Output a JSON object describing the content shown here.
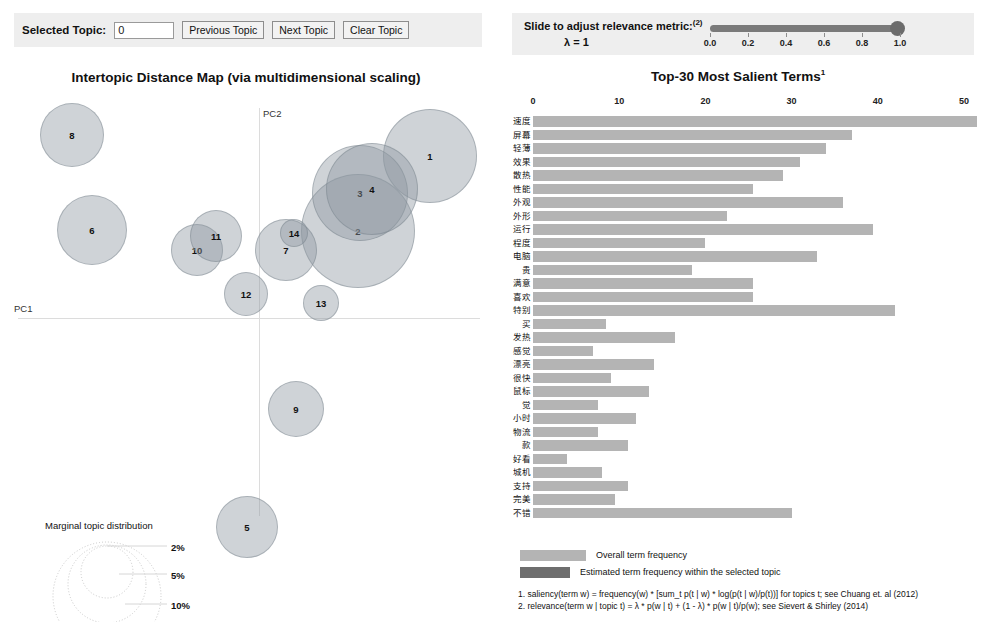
{
  "topic_control": {
    "label": "Selected Topic:",
    "selected_topic_value": "0",
    "previous_label": "Previous Topic",
    "next_label": "Next Topic",
    "clear_label": "Clear Topic"
  },
  "relevance_control": {
    "title": "Slide to adjust relevance metric:",
    "title_superscript": "(2)",
    "lambda_label": "λ = 1",
    "slider_value": 1.0,
    "tick_labels": [
      "0.0",
      "0.2",
      "0.4",
      "0.6",
      "0.8",
      "1.0"
    ]
  },
  "left_panel": {
    "title": "Intertopic Distance Map (via multidimensional scaling)",
    "x_axis_label": "PC1",
    "y_axis_label": "PC2",
    "marginal_legend": {
      "title": "Marginal topic distribution",
      "levels": [
        "2%",
        "5%",
        "10%"
      ]
    }
  },
  "right_panel": {
    "title": "Top-30 Most Salient Terms",
    "title_superscript": "1",
    "legend": {
      "overall": "Overall term frequency",
      "topic": "Estimated term frequency within the selected topic"
    },
    "footnotes": [
      "1. saliency(term w) = frequency(w) * [sum_t p(t | w) * log(p(t | w)/p(t))] for topics t; see Chuang et. al (2012)",
      "2. relevance(term w | topic t) = λ * p(w | t) + (1 - λ) * p(w | t)/p(w); see Sievert & Shirley (2014)"
    ]
  },
  "chart_data": [
    {
      "type": "scatter",
      "title": "Intertopic Distance Map (via multidimensional scaling)",
      "xlabel": "PC1",
      "ylabel": "PC2",
      "grid": false,
      "legend_position": "bottom-left",
      "note": "Bubble area is proportional to marginal topic distribution; x/y are MDS coordinates in px within the plot region.",
      "points": [
        {
          "topic": "1",
          "x": 430,
          "y": 156,
          "r": 47
        },
        {
          "topic": "2",
          "x": 358,
          "y": 231,
          "r": 57
        },
        {
          "topic": "3",
          "x": 360,
          "y": 193,
          "r": 48
        },
        {
          "topic": "4",
          "x": 372,
          "y": 189,
          "r": 46
        },
        {
          "topic": "5",
          "x": 247,
          "y": 527,
          "r": 31
        },
        {
          "topic": "6",
          "x": 92,
          "y": 230,
          "r": 35
        },
        {
          "topic": "7",
          "x": 286,
          "y": 250,
          "r": 31
        },
        {
          "topic": "8",
          "x": 72,
          "y": 135,
          "r": 32
        },
        {
          "topic": "9",
          "x": 296,
          "y": 409,
          "r": 28
        },
        {
          "topic": "10",
          "x": 197,
          "y": 250,
          "r": 26
        },
        {
          "topic": "11",
          "x": 216,
          "y": 236,
          "r": 26
        },
        {
          "topic": "12",
          "x": 246,
          "y": 294,
          "r": 22
        },
        {
          "topic": "13",
          "x": 321,
          "y": 303,
          "r": 18
        },
        {
          "topic": "14",
          "x": 294,
          "y": 233,
          "r": 14
        }
      ]
    },
    {
      "type": "bar",
      "orientation": "horizontal",
      "title": "Top-30 Most Salient Terms",
      "xlabel": "",
      "ylabel": "",
      "xlim": [
        0,
        52
      ],
      "xticks": [
        0,
        10,
        20,
        30,
        40,
        50
      ],
      "grid": false,
      "legend_position": "bottom",
      "series": [
        {
          "name": "Overall term frequency",
          "color": "#b4b4b4",
          "values": [
            51.5,
            37.0,
            34.0,
            31.0,
            29.0,
            25.5,
            36.0,
            22.5,
            39.5,
            20.0,
            33.0,
            18.5,
            25.5,
            25.5,
            42.0,
            8.5,
            16.5,
            7.0,
            14.0,
            9.0,
            13.5,
            7.5,
            12.0,
            7.5,
            11.0,
            4.0,
            8.0,
            11.0,
            9.5,
            30.0
          ]
        },
        {
          "name": "Estimated term frequency within the selected topic",
          "color": "#6e6e6e",
          "values": [
            0,
            0,
            0,
            0,
            0,
            0,
            0,
            0,
            0,
            0,
            0,
            0,
            0,
            0,
            0,
            0,
            0,
            0,
            0,
            0,
            0,
            0,
            0,
            0,
            0,
            0,
            0,
            0,
            0,
            0
          ]
        }
      ],
      "categories": [
        "速度",
        "屏幕",
        "轻薄",
        "效果",
        "散热",
        "性能",
        "外观",
        "外形",
        "运行",
        "程度",
        "电脑",
        "贵",
        "满意",
        "喜欢",
        "特别",
        "买",
        "发热",
        "感觉",
        "漂亮",
        "很快",
        "鼠标",
        "觉",
        "小时",
        "物流",
        "款",
        "好看",
        "城机",
        "支持",
        "完美",
        "不错"
      ]
    }
  ]
}
